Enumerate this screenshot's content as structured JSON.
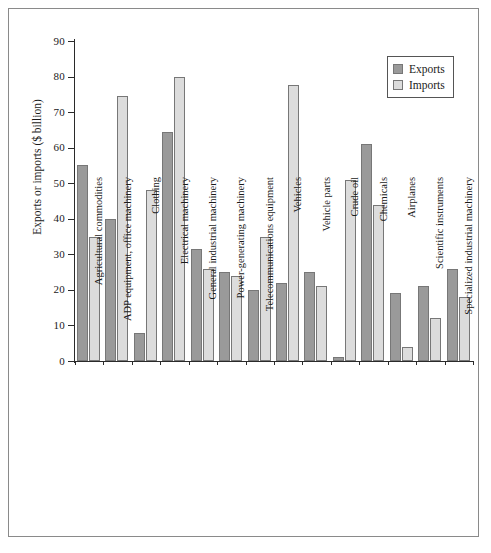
{
  "chart_data": {
    "type": "bar",
    "title": "",
    "xlabel": "",
    "ylabel": "Exports or imports ($ billion)",
    "ylim": [
      0,
      90
    ],
    "yticks": [
      0,
      10,
      20,
      30,
      40,
      50,
      60,
      70,
      80,
      90
    ],
    "grid": false,
    "legend_position": "top-right",
    "categories": [
      "Agricultural commodities",
      "ADP equipment, office machinery",
      "Clothing",
      "Electrical machinery",
      "General industrial machinery",
      "Power-generating machinery",
      "Telecommunications equipment",
      "Vehicles",
      "Vehicle parts",
      "Crude oil",
      "Chemicals",
      "Airplanes",
      "Scientific instruments",
      "Specialized industrial machinery"
    ],
    "series": [
      {
        "name": "Exports",
        "color": "#9a9a9a",
        "values": [
          55,
          40,
          8,
          64.5,
          31.5,
          25,
          20,
          22,
          25,
          1,
          61,
          19,
          21,
          26
        ]
      },
      {
        "name": "Imports",
        "color": "#dcdcdc",
        "values": [
          35,
          74.5,
          48,
          80,
          26,
          24,
          35,
          77.5,
          21,
          51,
          44,
          4,
          12,
          18
        ]
      }
    ]
  },
  "legend": {
    "items": [
      {
        "label": "Exports",
        "swatch": "exports"
      },
      {
        "label": "Imports",
        "swatch": "imports"
      }
    ]
  }
}
